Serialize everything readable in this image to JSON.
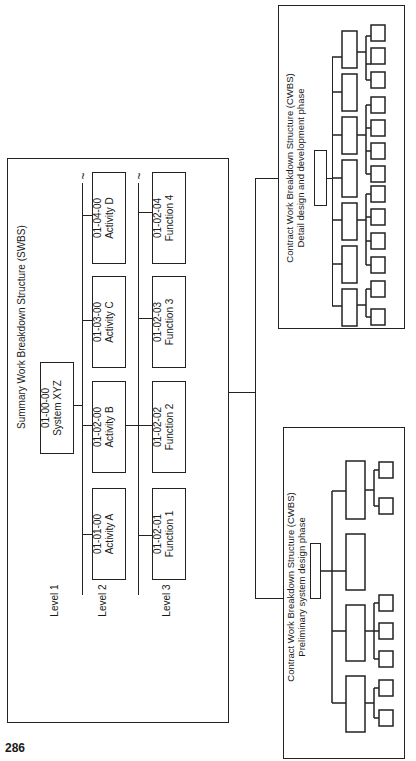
{
  "page_number": "286",
  "swbs": {
    "title": "Summary Work Breakdown Structure (SWBS)",
    "levels": [
      "Level 1",
      "Level 2",
      "Level 3"
    ],
    "level1": {
      "code": "01-00-00",
      "name": "System XYZ"
    },
    "level2": [
      {
        "code": "01-01-00",
        "name": "Activity A"
      },
      {
        "code": "01-02-00",
        "name": "Activity B"
      },
      {
        "code": "01-03-00",
        "name": "Activity C"
      },
      {
        "code": "01-04-00",
        "name": "Activity D"
      }
    ],
    "level3": [
      {
        "code": "01-02-01",
        "name": "Function 1"
      },
      {
        "code": "01-02-02",
        "name": "Function 2"
      },
      {
        "code": "01-02-03",
        "name": "Function 3"
      },
      {
        "code": "01-02-04",
        "name": "Function 4"
      }
    ],
    "continuation_symbol": "~"
  },
  "cwbs_detail": {
    "title": "Contract Work Breakdown Structure (CWBS)",
    "subtitle": "Detail design and development phase",
    "level2_count": 7,
    "level3_groups": [
      2,
      0,
      4,
      4,
      0,
      3,
      3
    ]
  },
  "cwbs_preliminary": {
    "title": "Contract Work Breakdown Structure (CWBS)",
    "subtitle": "Preliminary system design phase",
    "level2_count": 4,
    "level3_groups": [
      2,
      3,
      0,
      2
    ]
  }
}
